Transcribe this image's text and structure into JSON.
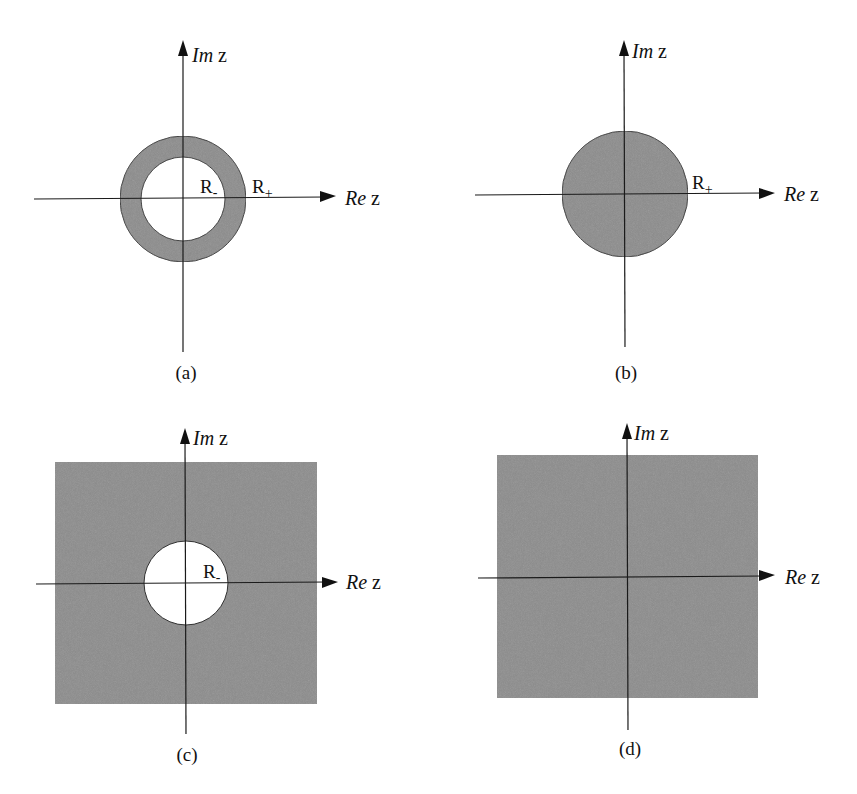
{
  "figure": {
    "fill_color": "#8c8c8c",
    "axis_labels": {
      "imaginary": {
        "prefix": "Im",
        "var": "z"
      },
      "real": {
        "prefix": "Re",
        "var": "z"
      }
    },
    "panels": [
      {
        "id": "a",
        "caption": "(a)",
        "region": "annulus",
        "labels": [
          {
            "base": "R",
            "sub": "-"
          },
          {
            "base": "R",
            "sub": "+"
          }
        ]
      },
      {
        "id": "b",
        "caption": "(b)",
        "region": "disk",
        "labels": [
          {
            "base": "R",
            "sub": "+"
          }
        ]
      },
      {
        "id": "c",
        "caption": "(c)",
        "region": "exterior-of-disk",
        "labels": [
          {
            "base": "R",
            "sub": "-"
          }
        ]
      },
      {
        "id": "d",
        "caption": "(d)",
        "region": "entire-plane",
        "labels": []
      }
    ]
  }
}
